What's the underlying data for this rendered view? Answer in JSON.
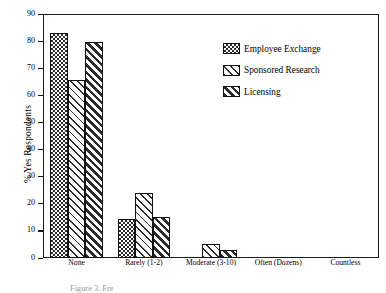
{
  "chart_data": {
    "type": "bar",
    "title": "",
    "xlabel": "",
    "ylabel": "% Yes Respondents",
    "ylim": [
      0,
      90
    ],
    "yticks": [
      0,
      10,
      20,
      30,
      40,
      50,
      60,
      70,
      80,
      90
    ],
    "grid": false,
    "legend_position": "upper right (inside plot area)",
    "categories": [
      "None",
      "Rarely (1-2)",
      "Moderate (3-10)",
      "Often (Dozens)",
      "Countless"
    ],
    "series": [
      {
        "name": "Employee Exchange",
        "pattern": "checkerboard",
        "values": [
          83,
          14.5,
          0,
          0,
          0
        ]
      },
      {
        "name": "Sponsored Research",
        "pattern": "light-diagonal-hatch",
        "values": [
          65.5,
          24,
          5,
          0,
          0
        ]
      },
      {
        "name": "Licensing",
        "pattern": "heavy-diagonal-hatch",
        "values": [
          79.5,
          15,
          3,
          0,
          0
        ]
      }
    ]
  },
  "axis": {
    "y_label": "% Yes Respondents",
    "y_tick_labels": [
      "0",
      "10",
      "20",
      "30",
      "40",
      "50",
      "60",
      "70",
      "80",
      "90"
    ],
    "x_tick_labels": [
      "None",
      "Rarely (1-2)",
      "Moderate (3-10)",
      "Often (Dozens)",
      "Countless"
    ]
  },
  "legend": {
    "items": [
      {
        "label": "Employee Exchange"
      },
      {
        "label": "Sponsored Research"
      },
      {
        "label": "Licensing"
      }
    ]
  },
  "caption": {
    "text": "Figure 3. Fre"
  },
  "colors": {
    "ink": "#1a1a1a",
    "pattern": "#2b2b2b",
    "background": "#ffffff"
  }
}
